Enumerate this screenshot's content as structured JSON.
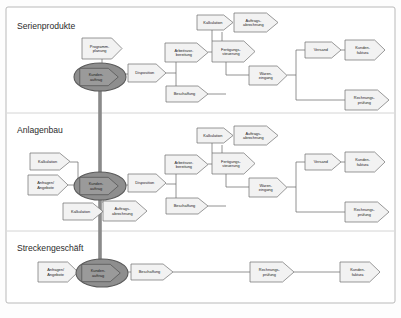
{
  "diagram": {
    "title_visible": false,
    "colors": {
      "frame_border": "#b9b9b9",
      "frame_fill": "#ffffff",
      "divider": "#c9c9c9",
      "node_stroke": "#6f6f6f",
      "node_fill": "#f2f2f2",
      "ellipse_fill": "#8e8e8e",
      "ellipse_stroke": "#5a5a5a",
      "connector": "#6f6f6f",
      "spine": "#8a8a8a",
      "text": "#1c1c1c",
      "title_text": "#2b2b2b"
    },
    "sections": [
      {
        "id": "serienprodukte",
        "title": "Serienprodukte",
        "nodes": [
          {
            "id": "sp-programmplanung",
            "label": "Programm-\nplanung",
            "shape": "arrow",
            "x": 82,
            "y": 38,
            "w": 40,
            "h": 21
          },
          {
            "id": "sp-kundenauftrag",
            "label": "Kunden-\nauftrag",
            "shape": "ellipse-arrow",
            "x": 74,
            "y": 63,
            "w": 52,
            "h": 28
          },
          {
            "id": "sp-disposition",
            "label": "Disposition",
            "shape": "arrow",
            "x": 128,
            "y": 64,
            "w": 38,
            "h": 18
          },
          {
            "id": "sp-kalkulation",
            "label": "Kalkulation",
            "shape": "arrow",
            "x": 197,
            "y": 15,
            "w": 36,
            "h": 15
          },
          {
            "id": "sp-auftragsabrechnung",
            "label": "Auftrags-\nabrechnung",
            "shape": "arrow",
            "x": 234,
            "y": 13,
            "w": 44,
            "h": 19
          },
          {
            "id": "sp-arbeitsvorbereitung",
            "label": "Arbeitsvor-\nbereitung",
            "shape": "arrow",
            "x": 165,
            "y": 43,
            "w": 43,
            "h": 19
          },
          {
            "id": "sp-fertigungssteuerung",
            "label": "Fertigungs-\nsteuerung",
            "shape": "arrow",
            "x": 212,
            "y": 41,
            "w": 43,
            "h": 21
          },
          {
            "id": "sp-beschaffung",
            "label": "Beschaffung",
            "shape": "arrow",
            "x": 166,
            "y": 86,
            "w": 42,
            "h": 16
          },
          {
            "id": "sp-wareneingang",
            "label": "Waren-\neingang",
            "shape": "arrow",
            "x": 249,
            "y": 66,
            "w": 38,
            "h": 19
          },
          {
            "id": "sp-versand",
            "label": "Versand",
            "shape": "arrow",
            "x": 305,
            "y": 42,
            "w": 36,
            "h": 16
          },
          {
            "id": "sp-kundenfaktura",
            "label": "Kunden-\nfaktura",
            "shape": "arrow",
            "x": 345,
            "y": 40,
            "w": 40,
            "h": 20
          },
          {
            "id": "sp-rechnungspruefung",
            "label": "Rechnungs-\nprüfung",
            "shape": "arrow",
            "x": 345,
            "y": 90,
            "w": 44,
            "h": 20
          }
        ]
      },
      {
        "id": "anlagenbau",
        "title": "Anlagenbau",
        "nodes": [
          {
            "id": "ab-kalkulation-top",
            "label": "Kalkulation",
            "shape": "arrow",
            "x": 30,
            "y": 153,
            "w": 40,
            "h": 17
          },
          {
            "id": "ab-anfragenangebote",
            "label": "Anfragen/\nAngebote",
            "shape": "arrow",
            "x": 28,
            "y": 175,
            "w": 40,
            "h": 20
          },
          {
            "id": "ab-kundenauftrag",
            "label": "Kunden-\nauftrag",
            "shape": "ellipse-arrow",
            "x": 74,
            "y": 172,
            "w": 52,
            "h": 28
          },
          {
            "id": "ab-kalkulation-bottom",
            "label": "Kalkulation",
            "shape": "arrow",
            "x": 63,
            "y": 203,
            "w": 40,
            "h": 17
          },
          {
            "id": "ab-auftragsabrechnung",
            "label": "Auftrags-\nabrechnung",
            "shape": "arrow",
            "x": 103,
            "y": 201,
            "w": 44,
            "h": 20
          },
          {
            "id": "ab-disposition",
            "label": "Disposition",
            "shape": "arrow",
            "x": 128,
            "y": 174,
            "w": 38,
            "h": 18
          },
          {
            "id": "ab-kalkulation-right",
            "label": "Kalkulation",
            "shape": "arrow",
            "x": 197,
            "y": 128,
            "w": 36,
            "h": 15
          },
          {
            "id": "ab-auftragsabrechnung-right",
            "label": "Auftrags-\nabrechnung",
            "shape": "arrow",
            "x": 234,
            "y": 126,
            "w": 44,
            "h": 19
          },
          {
            "id": "ab-arbeitsvorbereitung",
            "label": "Arbeitsvor-\nbereitung",
            "shape": "arrow",
            "x": 165,
            "y": 155,
            "w": 43,
            "h": 19
          },
          {
            "id": "ab-fertigungssteuerung",
            "label": "Fertigungs-\nsteuerung",
            "shape": "arrow",
            "x": 212,
            "y": 153,
            "w": 43,
            "h": 21
          },
          {
            "id": "ab-beschaffung",
            "label": "Beschaffung",
            "shape": "arrow",
            "x": 166,
            "y": 198,
            "w": 42,
            "h": 16
          },
          {
            "id": "ab-wareneingang",
            "label": "Waren-\neingang",
            "shape": "arrow",
            "x": 249,
            "y": 178,
            "w": 38,
            "h": 19
          },
          {
            "id": "ab-versand",
            "label": "Versand",
            "shape": "arrow",
            "x": 305,
            "y": 154,
            "w": 36,
            "h": 16
          },
          {
            "id": "ab-kundenfaktura",
            "label": "Kunden-\nfaktura",
            "shape": "arrow",
            "x": 345,
            "y": 152,
            "w": 40,
            "h": 20
          },
          {
            "id": "ab-rechnungspruefung",
            "label": "Rechnungs-\nprüfung",
            "shape": "arrow",
            "x": 345,
            "y": 202,
            "w": 44,
            "h": 20
          }
        ]
      },
      {
        "id": "streckengeschaeft",
        "title": "Streckengeschäft",
        "nodes": [
          {
            "id": "sg-anfragenangebote",
            "label": "Anfragen/\nAngebote",
            "shape": "arrow",
            "x": 38,
            "y": 262,
            "w": 40,
            "h": 20
          },
          {
            "id": "sg-kundenauftrag",
            "label": "Kunden-\nauftrag",
            "shape": "ellipse-arrow",
            "x": 76,
            "y": 259,
            "w": 52,
            "h": 28
          },
          {
            "id": "sg-beschaffung",
            "label": "Beschaffung",
            "shape": "arrow",
            "x": 131,
            "y": 264,
            "w": 42,
            "h": 16
          },
          {
            "id": "sg-rechnungspruefung",
            "label": "Rechnungs-\nprüfung",
            "shape": "arrow",
            "x": 250,
            "y": 262,
            "w": 44,
            "h": 20
          },
          {
            "id": "sg-kundenfaktura",
            "label": "Kunden-\nfaktura",
            "shape": "arrow",
            "x": 340,
            "y": 262,
            "w": 40,
            "h": 20
          }
        ]
      }
    ]
  }
}
